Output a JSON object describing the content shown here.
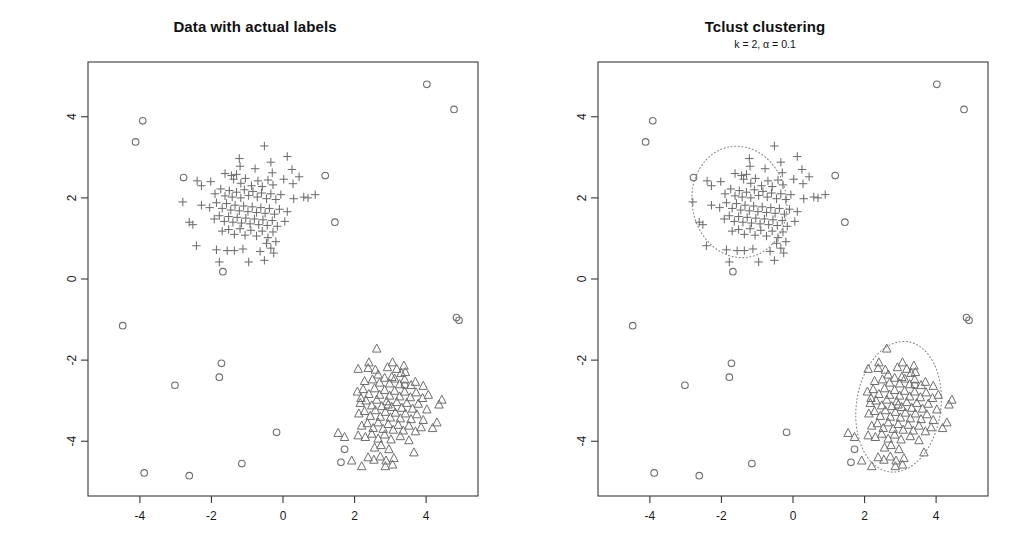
{
  "figure": {
    "width": 1020,
    "height": 556,
    "background": "#ffffff",
    "point_color": "#6e6e6e",
    "axis_color": "#3a3a3a",
    "ellipse_color": "#8a8a8a"
  },
  "panels": [
    {
      "id": "actual-labels",
      "title": "Data with actual labels",
      "subtitle": "",
      "axes": {
        "xlim": [
          -5.45,
          5.45
        ],
        "ylim": [
          -5.35,
          5.35
        ],
        "xticks": [
          -4,
          -2,
          0,
          2,
          4
        ],
        "xtick_labels": [
          "-4",
          "-2",
          "0",
          "2",
          "4"
        ],
        "yticks": [
          -4,
          -2,
          0,
          2,
          4
        ],
        "ytick_labels": [
          "-4",
          "-2",
          "0",
          "2",
          "4"
        ],
        "grid": false,
        "box": true
      },
      "ellipses": []
    },
    {
      "id": "tclust-clustering",
      "title": "Tclust clustering",
      "subtitle": "k = 2, α = 0.1",
      "axes": {
        "xlim": [
          -5.45,
          5.45
        ],
        "ylim": [
          -5.35,
          5.35
        ],
        "xticks": [
          -4,
          -2,
          0,
          2,
          4
        ],
        "xtick_labels": [
          "-4",
          "-2",
          "0",
          "2",
          "4"
        ],
        "yticks": [
          -4,
          -2,
          0,
          2,
          4
        ],
        "ytick_labels": [
          "-4",
          "-2",
          "0",
          "2",
          "4"
        ],
        "grid": false,
        "box": true
      },
      "ellipses": [
        {
          "cx": -1.5,
          "cy": 1.9,
          "rx": 1.32,
          "ry": 1.38,
          "rotation": -10,
          "style": "dotted"
        },
        {
          "cx": 2.95,
          "cy": -3.15,
          "rx": 1.18,
          "ry": 1.62,
          "rotation": 8,
          "style": "dotted"
        }
      ]
    }
  ],
  "chart_data": {
    "type": "scatter",
    "title": "Data with actual labels",
    "title_right": "Tclust clustering",
    "subtitle_right": "k = 2, α = 0.1",
    "xlabel": "",
    "ylabel": "",
    "xlim": [
      -5.45,
      5.45
    ],
    "ylim": [
      -5.35,
      5.35
    ],
    "xticks": [
      -4,
      -2,
      0,
      2,
      4
    ],
    "yticks": [
      -4,
      -2,
      0,
      2,
      4
    ],
    "legend": "none",
    "grid": false,
    "series": [
      {
        "name": "cluster-1",
        "marker": "plus",
        "color": "#6e6e6e",
        "center": [
          -1.5,
          1.9
        ],
        "n": 105,
        "points": [
          [
            -0.52,
            3.28
          ],
          [
            -1.22,
            2.97
          ],
          [
            -1.2,
            2.78
          ],
          [
            -0.78,
            2.72
          ],
          [
            -0.34,
            2.88
          ],
          [
            -0.3,
            2.62
          ],
          [
            0.12,
            3.02
          ],
          [
            0.25,
            2.7
          ],
          [
            -2.4,
            2.42
          ],
          [
            -2.02,
            2.4
          ],
          [
            -1.62,
            2.6
          ],
          [
            -1.44,
            2.55
          ],
          [
            -1.38,
            2.46
          ],
          [
            -1.3,
            2.58
          ],
          [
            -1.18,
            2.36
          ],
          [
            -1.05,
            2.48
          ],
          [
            -0.88,
            2.3
          ],
          [
            -0.7,
            2.42
          ],
          [
            -0.58,
            2.28
          ],
          [
            -0.42,
            2.44
          ],
          [
            -0.28,
            2.32
          ],
          [
            0.02,
            2.46
          ],
          [
            0.28,
            2.35
          ],
          [
            0.45,
            2.52
          ],
          [
            -1.9,
            2.1
          ],
          [
            -1.74,
            2.22
          ],
          [
            -1.62,
            2.05
          ],
          [
            -1.5,
            2.18
          ],
          [
            -1.42,
            2.02
          ],
          [
            -1.3,
            2.14
          ],
          [
            -1.18,
            2.0
          ],
          [
            -1.08,
            2.2
          ],
          [
            -0.96,
            2.06
          ],
          [
            -0.84,
            2.16
          ],
          [
            -0.72,
            2.02
          ],
          [
            -0.6,
            2.12
          ],
          [
            -0.46,
            1.98
          ],
          [
            -0.34,
            2.1
          ],
          [
            -0.2,
            1.96
          ],
          [
            -0.06,
            2.08
          ],
          [
            0.3,
            1.98
          ],
          [
            0.58,
            2.02
          ],
          [
            0.7,
            2.0
          ],
          [
            -2.28,
            1.82
          ],
          [
            -2.05,
            1.76
          ],
          [
            -1.86,
            1.88
          ],
          [
            -1.7,
            1.74
          ],
          [
            -1.58,
            1.86
          ],
          [
            -1.46,
            1.7
          ],
          [
            -1.34,
            1.82
          ],
          [
            -1.22,
            1.68
          ],
          [
            -1.1,
            1.8
          ],
          [
            -0.98,
            1.66
          ],
          [
            -0.86,
            1.78
          ],
          [
            -0.74,
            1.64
          ],
          [
            -0.62,
            1.76
          ],
          [
            -0.5,
            1.62
          ],
          [
            -0.38,
            1.74
          ],
          [
            -0.24,
            1.6
          ],
          [
            -0.1,
            1.72
          ],
          [
            0.12,
            1.66
          ],
          [
            -1.92,
            1.48
          ],
          [
            -1.78,
            1.56
          ],
          [
            -1.64,
            1.42
          ],
          [
            -1.52,
            1.54
          ],
          [
            -1.4,
            1.4
          ],
          [
            -1.28,
            1.52
          ],
          [
            -1.16,
            1.38
          ],
          [
            -1.04,
            1.5
          ],
          [
            -0.92,
            1.36
          ],
          [
            -0.8,
            1.48
          ],
          [
            -0.68,
            1.34
          ],
          [
            -0.56,
            1.46
          ],
          [
            -0.44,
            1.32
          ],
          [
            -0.3,
            1.44
          ],
          [
            -0.16,
            1.3
          ],
          [
            0.05,
            1.42
          ],
          [
            -2.62,
            1.4
          ],
          [
            -2.52,
            1.34
          ],
          [
            -2.8,
            1.9
          ],
          [
            -1.7,
            1.18
          ],
          [
            -1.52,
            1.22
          ],
          [
            -1.36,
            1.1
          ],
          [
            -1.2,
            1.24
          ],
          [
            -1.06,
            1.08
          ],
          [
            -0.9,
            1.2
          ],
          [
            -0.74,
            1.06
          ],
          [
            -0.58,
            1.18
          ],
          [
            -0.42,
            1.02
          ],
          [
            -0.28,
            1.16
          ],
          [
            -0.46,
            0.88
          ],
          [
            -0.34,
            0.76
          ],
          [
            -0.2,
            0.92
          ],
          [
            -2.42,
            0.82
          ],
          [
            -1.86,
            0.72
          ],
          [
            -1.56,
            0.7
          ],
          [
            -1.36,
            0.7
          ],
          [
            -1.12,
            0.74
          ],
          [
            -0.64,
            0.68
          ],
          [
            -0.26,
            0.64
          ],
          [
            -1.78,
            0.42
          ],
          [
            -0.96,
            0.42
          ],
          [
            -0.52,
            0.46
          ],
          [
            -2.28,
            2.3
          ],
          [
            0.9,
            2.08
          ]
        ]
      },
      {
        "name": "cluster-2",
        "marker": "triangle",
        "color": "#6e6e6e",
        "center": [
          2.95,
          -3.15
        ],
        "n": 105,
        "points": [
          [
            2.62,
            -1.72
          ],
          [
            2.1,
            -2.22
          ],
          [
            2.38,
            -2.2
          ],
          [
            2.58,
            -2.24
          ],
          [
            2.92,
            -2.18
          ],
          [
            3.18,
            -2.22
          ],
          [
            3.3,
            -2.32
          ],
          [
            3.42,
            -2.3
          ],
          [
            2.28,
            -2.52
          ],
          [
            2.5,
            -2.48
          ],
          [
            2.7,
            -2.56
          ],
          [
            2.84,
            -2.44
          ],
          [
            2.98,
            -2.58
          ],
          [
            3.12,
            -2.46
          ],
          [
            3.26,
            -2.6
          ],
          [
            3.4,
            -2.48
          ],
          [
            3.58,
            -2.62
          ],
          [
            3.7,
            -2.54
          ],
          [
            3.92,
            -2.64
          ],
          [
            2.08,
            -2.78
          ],
          [
            2.24,
            -2.72
          ],
          [
            2.4,
            -2.84
          ],
          [
            2.56,
            -2.7
          ],
          [
            2.7,
            -2.86
          ],
          [
            2.84,
            -2.74
          ],
          [
            2.98,
            -2.88
          ],
          [
            3.12,
            -2.76
          ],
          [
            3.26,
            -2.9
          ],
          [
            3.4,
            -2.78
          ],
          [
            3.56,
            -2.92
          ],
          [
            3.72,
            -2.8
          ],
          [
            3.9,
            -2.94
          ],
          [
            4.06,
            -2.86
          ],
          [
            2.16,
            -3.06
          ],
          [
            2.32,
            -3.0
          ],
          [
            2.48,
            -3.12
          ],
          [
            2.62,
            -2.98
          ],
          [
            2.76,
            -3.14
          ],
          [
            2.9,
            -3.02
          ],
          [
            3.04,
            -3.16
          ],
          [
            3.18,
            -3.04
          ],
          [
            3.32,
            -3.18
          ],
          [
            3.46,
            -3.06
          ],
          [
            3.62,
            -3.2
          ],
          [
            3.78,
            -3.08
          ],
          [
            4.02,
            -3.22
          ],
          [
            4.36,
            -3.1
          ],
          [
            2.12,
            -3.32
          ],
          [
            2.28,
            -3.26
          ],
          [
            2.44,
            -3.38
          ],
          [
            2.58,
            -3.24
          ],
          [
            2.72,
            -3.4
          ],
          [
            2.86,
            -3.28
          ],
          [
            3.0,
            -3.42
          ],
          [
            3.14,
            -3.3
          ],
          [
            3.28,
            -3.44
          ],
          [
            3.42,
            -3.32
          ],
          [
            3.58,
            -3.46
          ],
          [
            3.74,
            -3.34
          ],
          [
            3.92,
            -3.48
          ],
          [
            2.2,
            -3.62
          ],
          [
            2.36,
            -3.56
          ],
          [
            2.52,
            -3.68
          ],
          [
            2.66,
            -3.54
          ],
          [
            2.8,
            -3.7
          ],
          [
            2.94,
            -3.58
          ],
          [
            3.08,
            -3.72
          ],
          [
            3.22,
            -3.6
          ],
          [
            3.36,
            -3.74
          ],
          [
            3.52,
            -3.62
          ],
          [
            3.7,
            -3.76
          ],
          [
            2.1,
            -3.86
          ],
          [
            2.3,
            -3.9
          ],
          [
            2.48,
            -3.82
          ],
          [
            2.66,
            -3.94
          ],
          [
            2.84,
            -3.84
          ],
          [
            3.02,
            -3.96
          ],
          [
            3.28,
            -3.88
          ],
          [
            3.52,
            -3.98
          ],
          [
            2.56,
            -4.16
          ],
          [
            2.74,
            -4.1
          ],
          [
            2.96,
            -4.2
          ],
          [
            2.38,
            -4.4
          ],
          [
            2.54,
            -4.46
          ],
          [
            2.72,
            -4.38
          ],
          [
            2.88,
            -4.48
          ],
          [
            3.1,
            -4.42
          ],
          [
            1.72,
            -3.9
          ],
          [
            1.54,
            -3.8
          ],
          [
            4.3,
            -3.54
          ],
          [
            4.44,
            -2.98
          ],
          [
            3.06,
            -2.06
          ],
          [
            2.86,
            -4.62
          ],
          [
            3.06,
            -4.58
          ],
          [
            2.4,
            -2.06
          ],
          [
            3.66,
            -4.28
          ],
          [
            2.2,
            -4.62
          ],
          [
            1.92,
            -4.48
          ],
          [
            3.38,
            -2.14
          ],
          [
            3.86,
            -3.66
          ],
          [
            2.66,
            -2.36
          ],
          [
            3.04,
            -2.42
          ],
          [
            2.18,
            -2.94
          ],
          [
            4.18,
            -3.68
          ],
          [
            2.94,
            -3.1
          ]
        ]
      },
      {
        "name": "outliers",
        "marker": "circle",
        "color": "#6e6e6e",
        "n": 21,
        "points": [
          [
            4.02,
            4.8
          ],
          [
            4.78,
            4.18
          ],
          [
            -3.92,
            3.9
          ],
          [
            -4.12,
            3.38
          ],
          [
            1.18,
            2.55
          ],
          [
            -2.78,
            2.5
          ],
          [
            1.45,
            1.4
          ],
          [
            -1.68,
            0.18
          ],
          [
            4.85,
            -0.95
          ],
          [
            4.92,
            -1.02
          ],
          [
            -4.48,
            -1.15
          ],
          [
            -1.72,
            -2.08
          ],
          [
            -3.02,
            -2.62
          ],
          [
            -1.78,
            -2.42
          ],
          [
            -0.18,
            -3.78
          ],
          [
            1.72,
            -4.2
          ],
          [
            1.62,
            -4.52
          ],
          [
            -3.88,
            -4.78
          ],
          [
            -2.62,
            -4.85
          ],
          [
            3.4,
            -2.62
          ],
          [
            -1.15,
            -4.55
          ]
        ]
      }
    ]
  }
}
